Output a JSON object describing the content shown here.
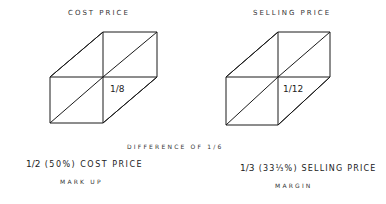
{
  "titles": {
    "left": "COST PRICE",
    "right": "SELLING PRICE"
  },
  "boxes": {
    "left": {
      "segment_label": "1/8"
    },
    "right": {
      "segment_label": "1/12"
    }
  },
  "difference": "DIFFERENCE OF 1/6",
  "notes": {
    "left_line1_frac": "1/2",
    "left_line1_rest": "(50%) COST PRICE",
    "left_line2": "MARK UP",
    "right_line1_frac": "1/3",
    "right_line1_rest": "(33⅓%) SELLING PRICE",
    "right_line2": "MARGIN"
  }
}
